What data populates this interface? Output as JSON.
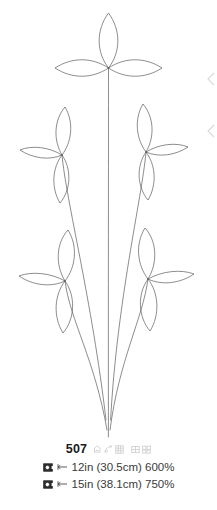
{
  "design": {
    "number": "507",
    "artwork": {
      "description": "floral-line-art-five-blossom-spray",
      "line_color": "#5c5c5c",
      "fill_color": "none",
      "background_color": "#ffffff",
      "blossom_count": 5
    },
    "format_icons": [
      "stitch-type-icon",
      "thread-chart-icon",
      "color-chart-icon",
      "grid-layout-icon",
      "multi-format-icon"
    ]
  },
  "sizes": [
    {
      "hoop_icon": "hoop-icon",
      "width_marker_icon": "width-arrow-icon",
      "label": "12in (30.5cm) 600%",
      "inches": "12in",
      "centimeters": "30.5cm",
      "scale": "600%"
    },
    {
      "hoop_icon": "hoop-icon",
      "width_marker_icon": "width-arrow-icon",
      "label": "15in (38.1cm) 750%",
      "inches": "15in",
      "centimeters": "38.1cm",
      "scale": "750%"
    }
  ],
  "edge_markers": [
    {
      "icon": "chevron-left-icon"
    },
    {
      "icon": "chevron-left-icon"
    }
  ]
}
